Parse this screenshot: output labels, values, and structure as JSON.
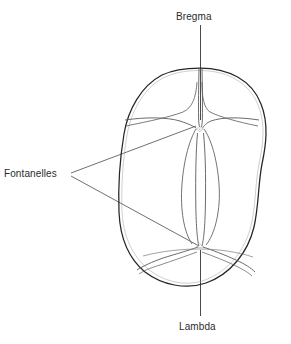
{
  "figure": {
    "background_color": "#ffffff",
    "outline_color": "#262626",
    "suture_color": "#5a5a5a",
    "leader_color": "#4a4a4a",
    "text_color": "#2b2b2b"
  },
  "labels": {
    "bregma": "Bregma",
    "lambda": "Lambda",
    "fontanelles": "Fontanelles"
  },
  "annotations": {
    "bregma_leader": "vertical-leader-line-top",
    "lambda_leader": "vertical-leader-line-bottom",
    "fontanelles_leader_upper": "leader-line-to-anterior-fontanelle",
    "fontanelles_leader_lower": "leader-line-to-posterior-fontanelle"
  },
  "structures": {
    "skull_outline": "cranial-vault-outline",
    "sagittal_suture": "sagittal-suture",
    "coronal_suture_left": "coronal-suture-left",
    "coronal_suture_right": "coronal-suture-right",
    "lambdoid_suture_left": "lambdoid-suture-left",
    "lambdoid_suture_right": "lambdoid-suture-right",
    "anterior_fontanelle": "anterior-fontanelle",
    "posterior_fontanelle": "posterior-fontanelle"
  }
}
